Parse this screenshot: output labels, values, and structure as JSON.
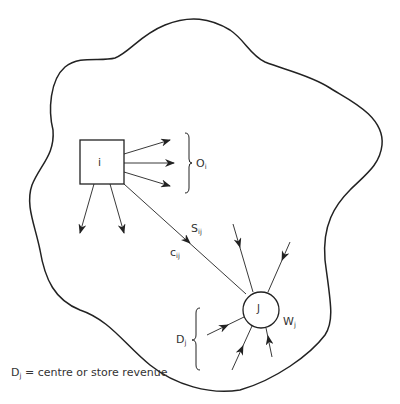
{
  "diagram": {
    "origin_node": {
      "label": "i",
      "shape": "square"
    },
    "destination_node": {
      "label": "J",
      "shape": "circle"
    },
    "labels": {
      "outflow": {
        "base": "O",
        "sub": "i"
      },
      "flow": {
        "base": "S",
        "sub": "ij"
      },
      "cost": {
        "base": "c",
        "sub": "ij"
      },
      "attractiveness": {
        "base": "W",
        "sub": "j"
      },
      "demand": {
        "base": "D",
        "sub": "j"
      }
    },
    "caption": {
      "base": "D",
      "sub": "j",
      "text": " = centre or store revenue"
    }
  },
  "colors": {
    "stroke": "#222222",
    "text": "#333333",
    "background": "#ffffff"
  }
}
